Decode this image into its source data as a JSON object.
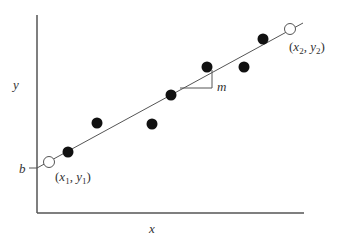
{
  "diagram": {
    "axes": {
      "x_label": "x",
      "y_label": "y"
    },
    "intercept_label": "b",
    "slope_label": "m",
    "endpoint_1": {
      "open": "(",
      "x": "x",
      "x_sub": "1",
      "comma": ", ",
      "y": "y",
      "y_sub": "1",
      "close": ")"
    },
    "endpoint_2": {
      "open": "(",
      "x": "x",
      "x_sub": "2",
      "comma": ", ",
      "y": "y",
      "y_sub": "2",
      "close": ")"
    },
    "data_points": [
      {
        "x": 68,
        "y": 152
      },
      {
        "x": 97,
        "y": 123
      },
      {
        "x": 152,
        "y": 124
      },
      {
        "x": 171,
        "y": 95
      },
      {
        "x": 207,
        "y": 67
      },
      {
        "x": 244,
        "y": 67
      },
      {
        "x": 263,
        "y": 39
      }
    ],
    "colors": {
      "axis": "#555555",
      "dot": "#111111",
      "text": "#333333",
      "background": "#ffffff"
    }
  }
}
